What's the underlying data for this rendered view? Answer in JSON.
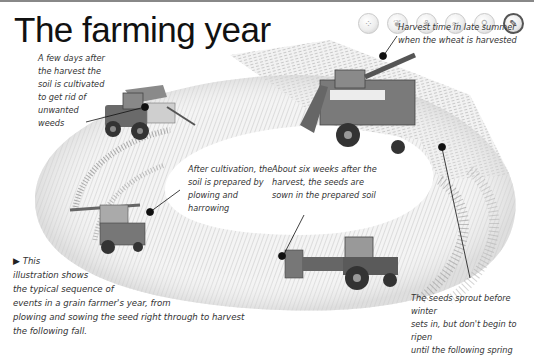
{
  "header": {
    "title": "The farming year"
  },
  "nav": {
    "buttons": [
      {
        "icon": "seeds-icon",
        "glyph": "⁘",
        "active": false
      },
      {
        "icon": "sprout-icon",
        "glyph": "❦",
        "active": false
      },
      {
        "icon": "plant-icon",
        "glyph": "⚘",
        "active": false
      },
      {
        "icon": "fish-icon",
        "glyph": "≈",
        "active": false
      },
      {
        "icon": "tree-icon",
        "glyph": "⚲",
        "active": false
      },
      {
        "icon": "wheat-icon",
        "glyph": "✎",
        "active": true
      }
    ]
  },
  "callouts": {
    "cultivation": "A few days after\nthe harvest the\nsoil is cultivated\nto get rid of\nunwanted\nweeds",
    "harvest": "Harvest time in late summer\nwhen the wheat is harvested",
    "plowing": "After cultivation, the\nsoil is prepared by\nplowing and\nharrowing",
    "sowing": "About six weeks after the\nharvest, the seeds are\nsown in the prepared soil",
    "sprouting": "The seeds sprout before winter\nsets in, but don't begin to ripen\nuntil the following spring"
  },
  "intro": {
    "arrow": "▶",
    "lines": [
      "This",
      "illustration shows",
      "the typical sequence of",
      "events in a grain farmer's year, from",
      "plowing and sowing the seed right through to harvest",
      "the following fall."
    ]
  },
  "colors": {
    "ring_light": "#f2f2f2",
    "ring_mid": "#d6d6d6",
    "ring_dark": "#9a9a9a",
    "machine": "#5a5a5a",
    "text": "#333333"
  }
}
